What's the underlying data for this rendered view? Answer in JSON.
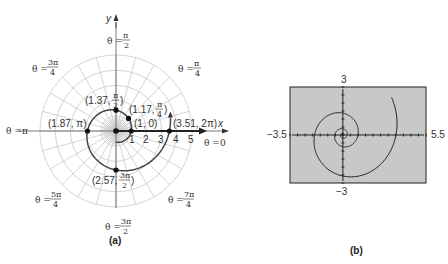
{
  "panel_a": {
    "caption": "(a)",
    "axis_labels": {
      "x": "x",
      "y": "y"
    },
    "tick_labels": [
      "1",
      "2",
      "3",
      "4",
      "5"
    ],
    "angle_labels": [
      {
        "id": "theta-0",
        "prefix": "θ = ",
        "num": "0",
        "den": ""
      },
      {
        "id": "theta-pi-4",
        "prefix": "θ = ",
        "num": "π",
        "den": "4"
      },
      {
        "id": "theta-pi-2",
        "prefix": "θ = ",
        "num": "π",
        "den": "2"
      },
      {
        "id": "theta-3pi-4",
        "prefix": "θ = ",
        "num": "3π",
        "den": "4"
      },
      {
        "id": "theta-pi",
        "prefix": "θ = ",
        "num": "π",
        "den": ""
      },
      {
        "id": "theta-5pi-4",
        "prefix": "θ = ",
        "num": "5π",
        "den": "4"
      },
      {
        "id": "theta-3pi-2",
        "prefix": "θ = ",
        "num": "3π",
        "den": "2"
      },
      {
        "id": "theta-7pi-4",
        "prefix": "θ = ",
        "num": "7π",
        "den": "4"
      }
    ],
    "points": [
      {
        "r": "1",
        "theta": "0",
        "label": "(1, 0)"
      },
      {
        "r": "1.17",
        "theta_num": "π",
        "theta_den": "4",
        "label_pre": "(1.17, "
      },
      {
        "r": "1.37",
        "theta_num": "π",
        "theta_den": "2",
        "label_pre": "(1.37, "
      },
      {
        "r": "1.87",
        "theta": "π",
        "label": "(1.87, π)"
      },
      {
        "r": "2.57",
        "theta_num": "3π",
        "theta_den": "2",
        "label_pre": "(2.57, "
      },
      {
        "r": "3.51",
        "theta": "2π",
        "label": "(3.51, 2π)"
      }
    ],
    "curve": "r = e^(θ/5)",
    "grid": {
      "circles": [
        1,
        2,
        3,
        4,
        5
      ],
      "radial_step_deg": 15
    }
  },
  "panel_b": {
    "caption": "(b)",
    "window": {
      "xmin": "−3.5",
      "xmax": "5.5",
      "ymin": "−3",
      "ymax": "3"
    },
    "screen_color": "#c8c8c8"
  },
  "chart_data": {
    "type": "line",
    "points": [
      {
        "r": 1,
        "theta": "0"
      },
      {
        "r": 1.17,
        "theta": "π/4"
      },
      {
        "r": 1.37,
        "theta": "π/2"
      },
      {
        "r": 1.87,
        "theta": "π"
      },
      {
        "r": 2.57,
        "theta": "3π/2"
      },
      {
        "r": 3.51,
        "theta": "2π"
      }
    ],
    "panel_b_window": {
      "xmin": -3.5,
      "xmax": 5.5,
      "ymin": -3,
      "ymax": 3
    }
  }
}
